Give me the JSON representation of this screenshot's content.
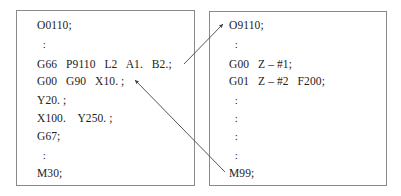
{
  "left_program": {
    "lines": [
      "O0110;",
      "  :",
      "G66   P9110   L2   A1.   B2.;",
      "G00   G90   X10. ;",
      "Y20. ;",
      "X100.    Y250. ;",
      "G67;",
      "  :",
      "M30;"
    ]
  },
  "right_program": {
    "lines": [
      "O9110;",
      "  :",
      "G00   Z – #1;",
      "G01   Z – #2   F200;",
      "  :",
      "  :",
      "  :",
      "  :",
      "M99;"
    ]
  },
  "arrows": [
    {
      "from": "G66 P9110 L2 A1. B2.;",
      "to": "O9110;",
      "meaning": "modal macro call"
    },
    {
      "from": "M99;",
      "to": "X10. ;",
      "meaning": "return after each move"
    }
  ],
  "colors": {
    "border": "#8a8a8a",
    "text": "#222222",
    "arrow": "#444444"
  }
}
